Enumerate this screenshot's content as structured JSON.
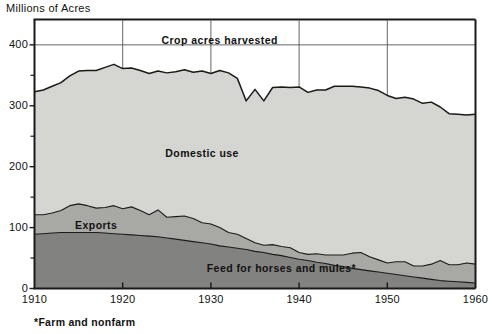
{
  "chart_data": {
    "type": "area",
    "stacked": true,
    "title": "",
    "ylabel": "Millions of Acres",
    "xlabel": "",
    "footnote": "*Farm and nonfarm",
    "grid": true,
    "legend_position": "inline-annotations",
    "xlim": [
      1910,
      1960
    ],
    "ylim": [
      0,
      440
    ],
    "y_ticks_major": [
      0,
      100,
      200,
      300,
      400
    ],
    "y_ticks_minor": [
      50,
      150,
      250,
      350
    ],
    "x_ticks": [
      1910,
      1920,
      1930,
      1940,
      1950,
      1960
    ],
    "gridlines_x": [
      1920,
      1930,
      1940,
      1950
    ],
    "gridlines_y": [
      400
    ],
    "total_line_label": "Crop acres harvested",
    "annotations": [
      {
        "text": "Crop acres harvested",
        "x": 1931,
        "y": 408
      },
      {
        "text": "Domestic use",
        "x": 1929,
        "y": 222
      },
      {
        "text": "Exports",
        "x": 1917,
        "y": 105
      },
      {
        "text": "Feed for horses and mules*",
        "x": 1938,
        "y": 34
      }
    ],
    "colors": {
      "domestic_use": "#d5d5d2",
      "exports": "#a8a8a5",
      "feed_horses_mules": "#828280",
      "line": "#1a1a1a",
      "axis": "#1a1a1a",
      "grid": "#555555",
      "background": "#ffffff",
      "text": "#111111"
    },
    "x": [
      1910,
      1911,
      1912,
      1913,
      1914,
      1915,
      1916,
      1917,
      1918,
      1919,
      1920,
      1921,
      1922,
      1923,
      1924,
      1925,
      1926,
      1927,
      1928,
      1929,
      1930,
      1931,
      1932,
      1933,
      1934,
      1935,
      1936,
      1937,
      1938,
      1939,
      1940,
      1941,
      1942,
      1943,
      1944,
      1945,
      1946,
      1947,
      1948,
      1949,
      1950,
      1951,
      1952,
      1953,
      1954,
      1955,
      1956,
      1957,
      1958,
      1959,
      1960
    ],
    "series": [
      {
        "name": "Feed for horses and mules*",
        "key": "feed_horses_mules",
        "values": [
          89,
          90,
          91,
          92,
          92,
          92,
          92,
          92,
          91,
          90,
          89,
          88,
          87,
          86,
          85,
          83,
          81,
          79,
          77,
          75,
          73,
          70,
          68,
          66,
          64,
          61,
          59,
          56,
          54,
          51,
          48,
          46,
          43,
          41,
          38,
          36,
          33,
          31,
          29,
          27,
          25,
          23,
          21,
          19,
          17,
          15,
          13,
          12,
          11,
          10,
          9
        ]
      },
      {
        "name": "Exports",
        "key": "exports",
        "values": [
          32,
          31,
          33,
          36,
          44,
          47,
          44,
          40,
          42,
          46,
          42,
          46,
          41,
          35,
          44,
          34,
          37,
          40,
          38,
          33,
          33,
          30,
          24,
          23,
          18,
          14,
          12,
          16,
          15,
          16,
          11,
          10,
          14,
          14,
          17,
          19,
          25,
          28,
          23,
          20,
          17,
          21,
          23,
          18,
          20,
          25,
          33,
          27,
          28,
          32,
          31
        ]
      },
      {
        "name": "Domestic use",
        "key": "domestic_use",
        "values": [
          202,
          205,
          208,
          210,
          213,
          218,
          222,
          226,
          230,
          232,
          230,
          228,
          230,
          232,
          228,
          237,
          238,
          240,
          240,
          249,
          247,
          258,
          262,
          256,
          226,
          252,
          237,
          258,
          262,
          263,
          272,
          266,
          269,
          271,
          277,
          277,
          274,
          272,
          277,
          278,
          275,
          268,
          270,
          274,
          267,
          266,
          252,
          248,
          247,
          243,
          246
        ]
      }
    ],
    "total": {
      "name": "Crop acres harvested",
      "values": [
        323,
        326,
        332,
        338,
        349,
        357,
        358,
        358,
        363,
        368,
        361,
        362,
        358,
        353,
        357,
        354,
        356,
        359,
        355,
        357,
        353,
        358,
        354,
        345,
        308,
        327,
        308,
        330,
        331,
        330,
        331,
        322,
        326,
        326,
        332,
        332,
        332,
        331,
        329,
        325,
        317,
        312,
        314,
        311,
        304,
        306,
        298,
        287,
        286,
        285,
        286
      ]
    }
  }
}
